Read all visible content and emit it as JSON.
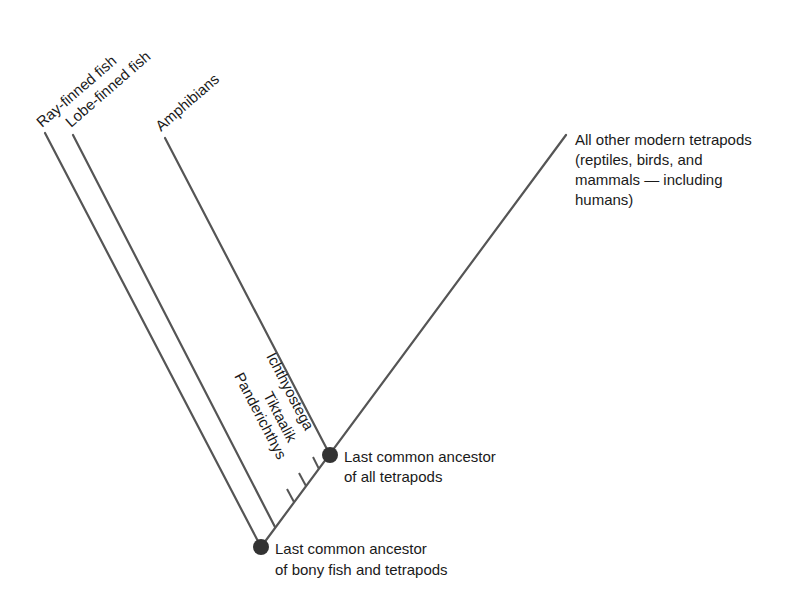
{
  "diagram": {
    "type": "cladogram",
    "colors": {
      "line": "#555555",
      "node": "#333333",
      "text": "#1a1a1a",
      "background": "#ffffff"
    },
    "taxa": {
      "ray_finned": "Ray-finned fish",
      "lobe_finned": "Lobe-finned fish",
      "amphibians": "Amphibians",
      "other_line1": "All other modern tetrapods",
      "other_line2": "(reptiles, birds, and",
      "other_line3": "mammals — including",
      "other_line4": "humans)"
    },
    "fossils": {
      "ichthyostega": "Ichthyostega",
      "tiktaalik": "Tiktaalik",
      "panderichthys": "Panderichthys"
    },
    "nodes": {
      "tetrapods_line1": "Last common ancestor",
      "tetrapods_line2": "of all tetrapods",
      "bony_fish_line1": "Last common ancestor",
      "bony_fish_line2": "of bony fish and tetrapods"
    }
  }
}
